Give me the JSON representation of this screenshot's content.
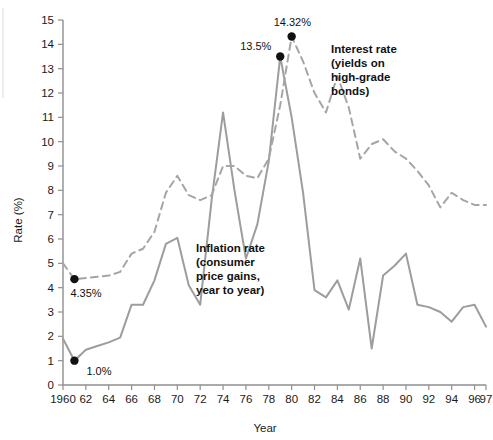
{
  "chart_data": {
    "type": "line",
    "title": "",
    "xlabel": "Year",
    "ylabel": "Rate (%)",
    "xlim": [
      1960,
      1997
    ],
    "ylim": [
      0,
      15
    ],
    "grid": false,
    "legend_position": "inline-annotations",
    "x_tick_labels": [
      "1960",
      "62",
      "64",
      "66",
      "68",
      "70",
      "72",
      "74",
      "76",
      "78",
      "80",
      "82",
      "84",
      "86",
      "88",
      "90",
      "92",
      "94",
      "96",
      "97"
    ],
    "x_tick_values": [
      1960,
      1962,
      1964,
      1966,
      1968,
      1970,
      1972,
      1974,
      1976,
      1978,
      1980,
      1982,
      1984,
      1986,
      1988,
      1990,
      1992,
      1994,
      1996,
      1997
    ],
    "y_tick_labels": [
      "0",
      "1",
      "2",
      "3",
      "4",
      "5",
      "6",
      "7",
      "8",
      "9",
      "10",
      "11",
      "12",
      "13",
      "14",
      "15"
    ],
    "y_tick_values": [
      0,
      1,
      2,
      3,
      4,
      5,
      6,
      7,
      8,
      9,
      10,
      11,
      12,
      13,
      14,
      15
    ],
    "x": [
      1960,
      1961,
      1962,
      1963,
      1964,
      1965,
      1966,
      1967,
      1968,
      1969,
      1970,
      1971,
      1972,
      1973,
      1974,
      1975,
      1976,
      1977,
      1978,
      1979,
      1980,
      1981,
      1982,
      1983,
      1984,
      1985,
      1986,
      1987,
      1988,
      1989,
      1990,
      1991,
      1992,
      1993,
      1994,
      1995,
      1996,
      1997
    ],
    "series": [
      {
        "name": "Inflation rate",
        "style": "solid",
        "color": "#9d9d9d",
        "label_lines": [
          "Inflation rate",
          "(consumer",
          "price gains,",
          "year to year)"
        ],
        "values": [
          1.9,
          1.0,
          1.45,
          1.6,
          1.75,
          1.95,
          3.3,
          3.3,
          4.3,
          5.8,
          6.05,
          4.1,
          3.3,
          7.6,
          11.2,
          8.0,
          5.2,
          6.6,
          9.2,
          13.5,
          11.0,
          7.9,
          3.9,
          3.6,
          4.3,
          3.1,
          5.2,
          1.5,
          4.5,
          4.9,
          5.4,
          3.3,
          3.2,
          3.0,
          2.6,
          3.2,
          3.3,
          2.4
        ]
      },
      {
        "name": "Interest rate",
        "style": "dashed",
        "color": "#a5a5a5",
        "label_lines": [
          "Interest rate",
          "(yields on",
          "high-grade",
          "bonds)"
        ],
        "values": [
          5.0,
          4.35,
          4.4,
          4.45,
          4.5,
          4.65,
          5.4,
          5.6,
          6.3,
          7.9,
          8.6,
          7.8,
          7.6,
          7.8,
          9.0,
          9.0,
          8.6,
          8.5,
          9.3,
          11.5,
          14.32,
          13.3,
          12.0,
          11.2,
          12.7,
          11.4,
          9.3,
          9.9,
          10.1,
          9.6,
          9.3,
          8.8,
          8.2,
          7.3,
          7.9,
          7.6,
          7.4,
          7.4
        ]
      }
    ],
    "annotations": [
      {
        "text": "1.0%",
        "x": 1961,
        "y": 1.0,
        "series": "Inflation rate",
        "marker": true,
        "label_dx": 12,
        "label_dy": 14
      },
      {
        "text": "4.35%",
        "x": 1961,
        "y": 4.35,
        "series": "Interest rate",
        "marker": true,
        "label_dx": -4,
        "label_dy": 18
      },
      {
        "text": "13.5%",
        "x": 1979,
        "y": 13.5,
        "series": "Inflation rate",
        "marker": true,
        "label_dx": -40,
        "label_dy": -7
      },
      {
        "text": "14.32%",
        "x": 1980,
        "y": 14.32,
        "series": "Interest rate",
        "marker": true,
        "label_dx": -18,
        "label_dy": -11
      }
    ]
  },
  "colors": {
    "inflation_line": "#9d9d9d",
    "interest_line": "#a5a5a5",
    "axis": "#8f8f8f",
    "text": "#111111",
    "marker": "#111111",
    "background": "#ffffff"
  }
}
